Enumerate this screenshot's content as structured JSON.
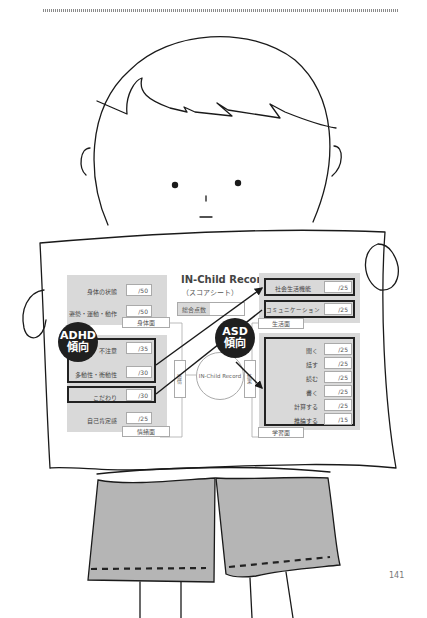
{
  "page": {
    "number": "141"
  },
  "sheet": {
    "title": "IN-Child Record",
    "subtitle": "（スコアシート）",
    "total_label": "総合点数",
    "center_circle": "IN-Child Record",
    "left_connector": "感情",
    "right_connector": "結果",
    "panels": {
      "physical": {
        "tag": "身体面",
        "items": [
          {
            "label": "身体の状態",
            "max": "/50"
          },
          {
            "label": "姿勢・運動・動作",
            "max": "/50"
          }
        ]
      },
      "emotional": {
        "tag": "情緒面",
        "items": [
          {
            "label": "不注意",
            "max": "/35"
          },
          {
            "label": "多動性・衝動性",
            "max": "/30"
          },
          {
            "label": "こだわり",
            "max": "/30"
          },
          {
            "label": "自己肯定感",
            "max": "/25"
          }
        ]
      },
      "life": {
        "tag": "生活面",
        "items": [
          {
            "label": "社会生活機能",
            "max": "/25"
          },
          {
            "label": "コミュニケーション",
            "max": "/25"
          }
        ]
      },
      "learning": {
        "tag": "学習面",
        "items": [
          {
            "label": "聞く",
            "max": "/25"
          },
          {
            "label": "話す",
            "max": "/25"
          },
          {
            "label": "読む",
            "max": "/25"
          },
          {
            "label": "書く",
            "max": "/25"
          },
          {
            "label": "計算する",
            "max": "/25"
          },
          {
            "label": "推論する",
            "max": "/15"
          }
        ]
      }
    },
    "badges": {
      "adhd": {
        "line1": "ADHD",
        "line2": "傾向"
      },
      "asd": {
        "line1": "ASD",
        "line2": "傾向"
      }
    }
  },
  "colors": {
    "panel": "#d9d9d9",
    "badge": "#1f1f1f",
    "shorts": "#b5b5b5",
    "line": "#222222"
  }
}
